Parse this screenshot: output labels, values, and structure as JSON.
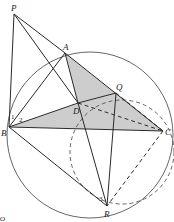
{
  "figure": {
    "points": {
      "P": {
        "label": "P",
        "x": 14,
        "y": 14
      },
      "A": {
        "label": "A",
        "x": 65,
        "y": 53
      },
      "B": {
        "label": "B",
        "x": 9,
        "y": 127
      },
      "C": {
        "label": "C",
        "x": 163,
        "y": 131
      },
      "D": {
        "label": "D",
        "x": 78,
        "y": 103
      },
      "Q": {
        "label": "Q",
        "x": 116,
        "y": 93
      },
      "R": {
        "label": "R",
        "x": 107,
        "y": 206
      }
    },
    "angle_labels": {
      "one": "1",
      "two": "2",
      "three": "3"
    },
    "corner_mark": "O",
    "colors": {
      "line": "#2a2a2a",
      "circle": "#555555",
      "shade": "#c8c8c8"
    }
  }
}
